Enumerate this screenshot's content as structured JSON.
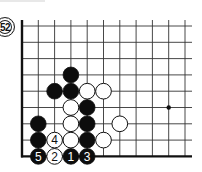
{
  "diagram": {
    "label": "52",
    "grid": {
      "origin_x": 22,
      "origin_y": 26,
      "spacing": 16.3,
      "cols": 11,
      "rows": 9,
      "right_extent": 192,
      "line_color": "#333333",
      "edge_color": "#111111",
      "edges": [
        "left",
        "bottom"
      ]
    },
    "hoshi": [
      {
        "col": 9,
        "row": 5
      }
    ],
    "stones": [
      {
        "col": 3,
        "row": 3,
        "color": "black",
        "number": ""
      },
      {
        "col": 2,
        "row": 4,
        "color": "black",
        "number": ""
      },
      {
        "col": 3,
        "row": 4,
        "color": "black",
        "number": ""
      },
      {
        "col": 4,
        "row": 4,
        "color": "white",
        "number": ""
      },
      {
        "col": 5,
        "row": 4,
        "color": "white",
        "number": ""
      },
      {
        "col": 3,
        "row": 5,
        "color": "white",
        "number": ""
      },
      {
        "col": 4,
        "row": 5,
        "color": "black",
        "number": ""
      },
      {
        "col": 1,
        "row": 6,
        "color": "black",
        "number": ""
      },
      {
        "col": 3,
        "row": 6,
        "color": "white",
        "number": ""
      },
      {
        "col": 4,
        "row": 6,
        "color": "black",
        "number": ""
      },
      {
        "col": 6,
        "row": 6,
        "color": "white",
        "number": ""
      },
      {
        "col": 1,
        "row": 7,
        "color": "black",
        "number": ""
      },
      {
        "col": 2,
        "row": 7,
        "color": "white",
        "number": "4"
      },
      {
        "col": 3,
        "row": 7,
        "color": "white",
        "number": ""
      },
      {
        "col": 4,
        "row": 7,
        "color": "black",
        "number": ""
      },
      {
        "col": 5,
        "row": 7,
        "color": "white",
        "number": ""
      },
      {
        "col": 1,
        "row": 8,
        "color": "black",
        "number": "5"
      },
      {
        "col": 2,
        "row": 8,
        "color": "white",
        "number": "2"
      },
      {
        "col": 3,
        "row": 8,
        "color": "black",
        "number": "1"
      },
      {
        "col": 4,
        "row": 8,
        "color": "black",
        "number": "3"
      }
    ]
  }
}
